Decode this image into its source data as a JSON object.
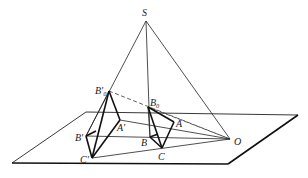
{
  "figure": {
    "type": "perspective-projection-diagram",
    "labels": {
      "S": "S",
      "B0_prime": "B′₀",
      "B0": "B₀",
      "A_prime": "A′",
      "A": "A",
      "B_prime": "B′",
      "B": "B",
      "C_prime": "C′",
      "C": "C",
      "O": "O"
    },
    "points": {
      "S": [
        146,
        21
      ],
      "B0_prime": [
        109,
        91
      ],
      "B0": [
        148,
        107
      ],
      "A_prime": [
        120,
        120
      ],
      "A": [
        174,
        122
      ],
      "B_prime": [
        86,
        136
      ],
      "B": [
        150,
        137
      ],
      "C_prime": [
        92,
        158
      ],
      "C": [
        162,
        148
      ],
      "O": [
        230,
        139
      ]
    },
    "plane": [
      [
        12,
        163
      ],
      [
        228,
        164
      ],
      [
        298,
        115
      ],
      [
        86,
        112
      ]
    ],
    "colors": {
      "line": "#111111",
      "background": "#ffffff"
    }
  }
}
